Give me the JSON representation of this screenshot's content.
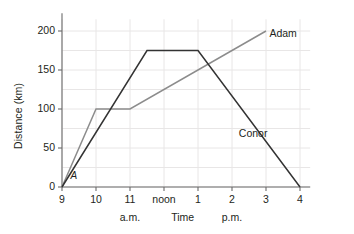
{
  "chart_data": {
    "type": "line",
    "title": "",
    "xlabel": "Time",
    "ylabel": "Distance (km)",
    "x_tick_labels": [
      "9",
      "10",
      "11",
      "noon",
      "1",
      "2",
      "3",
      "4"
    ],
    "x_tick_hours": [
      9,
      10,
      11,
      12,
      13,
      14,
      15,
      16
    ],
    "y_tick_labels": [
      "0",
      "50",
      "100",
      "150",
      "200"
    ],
    "y_tick_values": [
      0,
      50,
      100,
      150,
      200
    ],
    "xlim": [
      9,
      16.3
    ],
    "ylim": [
      0,
      215
    ],
    "grid": true,
    "legend_position": "inline-end-of-line",
    "annotations": [
      {
        "text": "A",
        "x": 9.25,
        "y": 6,
        "style": "italic"
      }
    ],
    "period_notes": [
      {
        "text": "a.m.",
        "x": 11.0
      },
      {
        "text": "p.m.",
        "x": 14.0
      }
    ],
    "series": [
      {
        "name": "Adam",
        "color": "#8c8c8c",
        "label_x": 15.1,
        "label_y": 196,
        "points": [
          {
            "x": 9,
            "y": 0
          },
          {
            "x": 10,
            "y": 100
          },
          {
            "x": 11,
            "y": 100
          },
          {
            "x": 15,
            "y": 200
          }
        ]
      },
      {
        "name": "Conor",
        "color": "#333333",
        "label_x": 14.2,
        "label_y": 68,
        "points": [
          {
            "x": 9,
            "y": 0
          },
          {
            "x": 11.5,
            "y": 175
          },
          {
            "x": 13,
            "y": 175
          },
          {
            "x": 16,
            "y": 0
          }
        ]
      }
    ]
  }
}
